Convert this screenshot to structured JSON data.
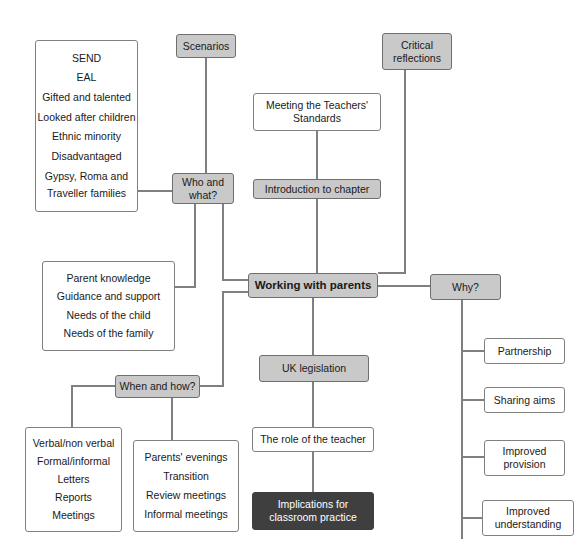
{
  "diagram": {
    "colors": {
      "grey_fill": "#c9c9c9",
      "dark_fill": "#3f3f3f",
      "white_fill": "#ffffff",
      "border": "#808080",
      "edge": "#808080",
      "text": "#1a1a1a",
      "text_on_dark": "#ffffff"
    },
    "nodes": {
      "pupil_groups": {
        "style": "white",
        "lines": [
          "SEND",
          "EAL",
          "Gifted and talented",
          "Looked after children",
          "Ethnic minority",
          "Disadvantaged",
          "Gypsy, Roma and",
          "Traveller families"
        ]
      },
      "scenarios": {
        "style": "grey",
        "lines": [
          "Scenarios"
        ]
      },
      "who_and_what": {
        "style": "grey",
        "lines": [
          "Who and",
          "what?"
        ]
      },
      "critical_reflections": {
        "style": "grey",
        "lines": [
          "Critical",
          "reflections"
        ]
      },
      "meeting_standards": {
        "style": "white",
        "lines": [
          "Meeting the Teachers'",
          "Standards"
        ]
      },
      "introduction_to_chapter": {
        "style": "grey",
        "lines": [
          "Introduction to chapter"
        ]
      },
      "working_with_parents": {
        "style": "grey-bold",
        "lines": [
          "Working with parents"
        ]
      },
      "why": {
        "style": "grey",
        "lines": [
          "Why?"
        ]
      },
      "parent_needs": {
        "style": "white",
        "lines": [
          "Parent knowledge",
          "Guidance and support",
          "Needs of the child",
          "Needs of the family"
        ]
      },
      "when_and_how": {
        "style": "grey",
        "lines": [
          "When and how?"
        ]
      },
      "uk_legislation": {
        "style": "grey",
        "lines": [
          "UK legislation"
        ]
      },
      "role_of_teacher": {
        "style": "white",
        "lines": [
          "The role of the teacher"
        ]
      },
      "implications": {
        "style": "dark",
        "lines": [
          "Implications for",
          "classroom practice"
        ]
      },
      "communication_methods": {
        "style": "white",
        "lines": [
          "Verbal/non verbal",
          "Formal/informal",
          "Letters",
          "Reports",
          "Meetings"
        ]
      },
      "meeting_types": {
        "style": "white",
        "lines": [
          "Parents' evenings",
          "Transition",
          "Review meetings",
          "Informal meetings"
        ]
      },
      "partnership": {
        "style": "white",
        "lines": [
          "Partnership"
        ]
      },
      "sharing_aims": {
        "style": "white",
        "lines": [
          "Sharing aims"
        ]
      },
      "improved_provision": {
        "style": "white",
        "lines": [
          "Improved",
          "provision"
        ]
      },
      "improved_understanding": {
        "style": "white",
        "lines": [
          "Improved",
          "understanding"
        ]
      }
    },
    "edges": [
      {
        "from": "scenarios",
        "to": "who_and_what"
      },
      {
        "from": "pupil_groups",
        "to": "who_and_what"
      },
      {
        "from": "who_and_what",
        "to": "parent_needs"
      },
      {
        "from": "who_and_what",
        "to": "working_with_parents"
      },
      {
        "from": "meeting_standards",
        "to": "introduction_to_chapter"
      },
      {
        "from": "introduction_to_chapter",
        "to": "working_with_parents"
      },
      {
        "from": "critical_reflections",
        "to": "working_with_parents"
      },
      {
        "from": "working_with_parents",
        "to": "why"
      },
      {
        "from": "working_with_parents",
        "to": "when_and_how"
      },
      {
        "from": "working_with_parents",
        "to": "uk_legislation"
      },
      {
        "from": "uk_legislation",
        "to": "role_of_teacher"
      },
      {
        "from": "role_of_teacher",
        "to": "implications"
      },
      {
        "from": "when_and_how",
        "to": "communication_methods"
      },
      {
        "from": "when_and_how",
        "to": "meeting_types"
      },
      {
        "from": "why",
        "to": "partnership"
      },
      {
        "from": "why",
        "to": "sharing_aims"
      },
      {
        "from": "why",
        "to": "improved_provision"
      },
      {
        "from": "why",
        "to": "improved_understanding"
      }
    ]
  }
}
